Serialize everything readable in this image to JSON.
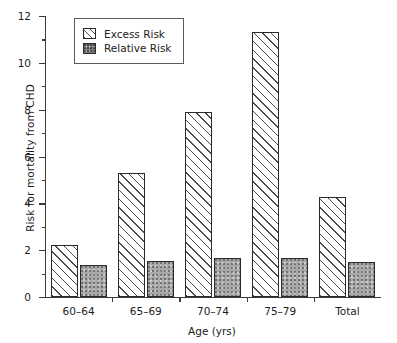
{
  "chart_data": {
    "type": "bar",
    "title": "",
    "xlabel": "Age (yrs)",
    "ylabel": "Risk for mortality from CHD",
    "categories": [
      "60–64",
      "65–69",
      "70–74",
      "75–79",
      "Total"
    ],
    "series": [
      {
        "name": "Excess Risk",
        "values": [
          2.2,
          5.3,
          7.9,
          11.3,
          4.25
        ]
      },
      {
        "name": "Relative Risk",
        "values": [
          1.35,
          1.55,
          1.65,
          1.65,
          1.5
        ]
      }
    ],
    "ylim": [
      0,
      12
    ],
    "ytick_labels": [
      "0",
      "2",
      "4",
      "6",
      "8",
      "10",
      "12"
    ],
    "ytick_values": [
      0,
      2,
      4,
      6,
      8,
      10,
      12
    ],
    "yminor_values": [
      1,
      3,
      5,
      7,
      9,
      11
    ],
    "grid": false,
    "legend_position": "top-left",
    "colors": {
      "excess_fill": "#ffffff",
      "excess_hatch": "#4a4a4a",
      "relative_fill": "#a9a9a9",
      "bar_outline": "#2b2b2b",
      "axis": "#3a3a3a",
      "text": "#1c1c1c"
    }
  },
  "legend": {
    "items": [
      {
        "label": "Excess Risk",
        "pattern": "diagonal-hatch"
      },
      {
        "label": "Relative Risk",
        "pattern": "gray-stipple"
      }
    ]
  }
}
